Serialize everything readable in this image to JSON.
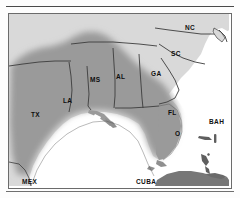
{
  "figure": {
    "type": "range-distribution-map",
    "region": "Southeastern United States, Gulf of Mexico and Caribbean",
    "legend_note": "Shaded area indicates distribution range"
  },
  "colors": {
    "range_fill": "#9a9a9a",
    "land_fill": "#d9d9d9",
    "water_fill": "#ffffff",
    "border_line": "#6b6b6b",
    "state_line": "#3c3c3c",
    "cuba_fill": "#777777",
    "label_text": "#1a1a1a",
    "rule": "#4a4a4a"
  },
  "labels": [
    {
      "id": "nc",
      "text": "NC",
      "name": "North Carolina",
      "x": 184,
      "y": 24,
      "shaded": false
    },
    {
      "id": "sc",
      "text": "SC",
      "name": "South Carolina",
      "x": 170,
      "y": 50,
      "shaded": false
    },
    {
      "id": "ga",
      "text": "GA",
      "name": "Georgia",
      "x": 150,
      "y": 70,
      "shaded": true
    },
    {
      "id": "al",
      "text": "AL",
      "name": "Alabama",
      "x": 115,
      "y": 73,
      "shaded": true
    },
    {
      "id": "ms",
      "text": "MS",
      "name": "Mississippi",
      "x": 89,
      "y": 76,
      "shaded": true
    },
    {
      "id": "la",
      "text": "LA",
      "name": "Louisiana",
      "x": 62,
      "y": 97,
      "shaded": true
    },
    {
      "id": "tx",
      "text": "TX",
      "name": "Texas",
      "x": 30,
      "y": 111,
      "shaded": true
    },
    {
      "id": "fl",
      "text": "FL",
      "name": "Florida",
      "x": 167,
      "y": 109,
      "shaded": true
    },
    {
      "id": "fl2",
      "text": "O",
      "name": "Florida peninsula marker",
      "x": 174,
      "y": 130,
      "shaded": true
    },
    {
      "id": "bah",
      "text": "BAH",
      "name": "Bahamas",
      "x": 208,
      "y": 118,
      "shaded": false
    },
    {
      "id": "mex",
      "text": "MEX",
      "name": "Mexico",
      "x": 21,
      "y": 178,
      "shaded": false
    },
    {
      "id": "cuba",
      "text": "CUBA",
      "name": "Cuba",
      "x": 135,
      "y": 178,
      "shaded": false
    }
  ],
  "features": {
    "bahamas_islands": 4,
    "cuba_landmass": 1,
    "gulf_of_mexico": "unlabeled water body",
    "atlantic_ocean": "unlabeled water body"
  }
}
